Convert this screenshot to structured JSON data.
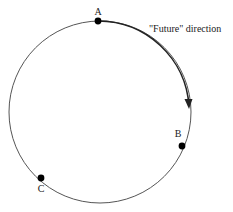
{
  "diagram": {
    "circle": {
      "cx": 100,
      "cy": 112,
      "r": 91,
      "stroke": "#444444"
    },
    "points": [
      {
        "id": "A",
        "label": "A",
        "x": 98,
        "y": 21,
        "label_x": 98,
        "label_y": 15
      },
      {
        "id": "B",
        "label": "B",
        "x": 182,
        "y": 146,
        "label_x": 178,
        "label_y": 137
      },
      {
        "id": "C",
        "label": "C",
        "x": 41,
        "y": 178,
        "label_x": 41,
        "label_y": 192
      }
    ],
    "annotation": {
      "text": "\"Future\" direction",
      "x": 149,
      "y": 32
    },
    "arrow": {
      "direction": "clockwise",
      "from_point": "A",
      "to_point": "B"
    },
    "colors": {
      "line": "#444444",
      "dot": "#000000",
      "text": "#222222"
    }
  }
}
